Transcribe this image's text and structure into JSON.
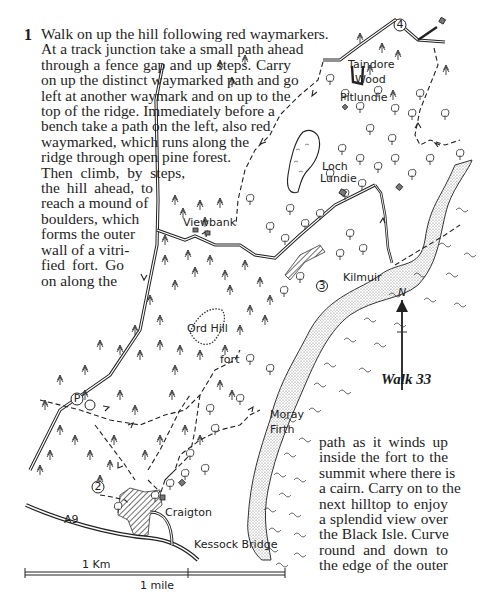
{
  "step": {
    "number": "1",
    "lines_top": [
      "Walk on up the hill following red waymarkers.",
      "At a track junction take a small path ahead",
      "through a fence gap and up steps. Carry",
      "on up the distinct waymarked path and go",
      "left at another waymark and on up to the",
      "top of the ridge. Immediately before a",
      "bench take a path on the left, also red",
      "waymarked, which runs along the",
      "ridge through open pine forest.",
      "Then climb, by steps,",
      "the hill ahead, to",
      "reach a mound of",
      "boulders, which",
      "forms the outer",
      "wall of a vitri-",
      "fied fort. Go",
      "on along the"
    ],
    "lines_bottom": [
      "path as it winds up",
      "inside the fort to the",
      "summit where there is",
      "a cairn. Carry on to the",
      "next hilltop to enjoy",
      "a splendid view over",
      "the Black Isle. Curve",
      "round and down to",
      "the edge of the outer"
    ]
  },
  "map": {
    "caption": "Walk 33",
    "north_label": "N",
    "place_labels": {
      "taindore_wood_1": "Taindore",
      "taindore_wood_2": "Wood",
      "pitlundie": "Pitlundie",
      "loch_lundie_1": "Loch",
      "loch_lundie_2": "Lundie",
      "viewbank": "Viewbank",
      "kilmuir": "Kilmuir",
      "ord_hill": "Ord Hill",
      "fort": "fort",
      "moray_firth_1": "Moray",
      "moray_firth_2": "Firth",
      "craigton": "Craigton",
      "a9": "A9",
      "kessock_bridge": "Kessock Bridge"
    },
    "markers": {
      "parking": "P",
      "waypoint_2": "2",
      "waypoint_3": "3",
      "waypoint_4": "4"
    },
    "scale": {
      "km_label": "1 Km",
      "mile_label": "1 mile"
    }
  }
}
